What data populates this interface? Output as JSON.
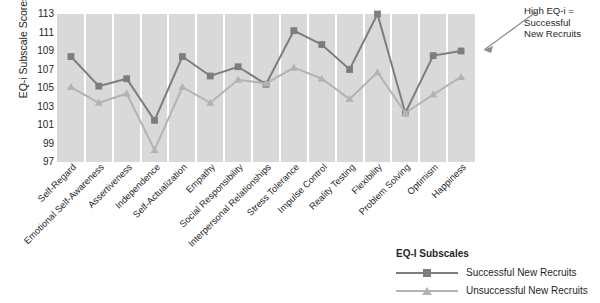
{
  "chart_data": {
    "type": "line",
    "title": "",
    "xlabel": "",
    "ylabel": "EQ-i Subscale Scores",
    "ylim": [
      97,
      113
    ],
    "ytick_step": 2,
    "yticks": [
      113,
      111,
      109,
      107,
      105,
      103,
      101,
      99,
      97
    ],
    "grid": true,
    "legend_position": "bottom-right",
    "categories": [
      "Self-Regard",
      "Emotional Self-Awareness",
      "Assertiveness",
      "Independence",
      "Self-Actualization",
      "Empathy",
      "Social Responsibility",
      "Interpersonal Relationships",
      "Stress Tolerance",
      "Impulse Control",
      "Reality Testing",
      "Flexibility",
      "Problem Solving",
      "Optimism",
      "Happiness"
    ],
    "series": [
      {
        "name": "Successful New Recruits",
        "color": "#7d7d7d",
        "marker": "square",
        "values": [
          108.4,
          105.2,
          106.0,
          101.5,
          108.4,
          106.3,
          107.3,
          105.4,
          111.2,
          109.7,
          107.0,
          113.0,
          102.3,
          108.5,
          109.0
        ]
      },
      {
        "name": "Unsuccessful New Recruits",
        "color": "#b3b3b3",
        "marker": "triangle",
        "values": [
          105.1,
          103.4,
          104.4,
          98.3,
          105.1,
          103.4,
          105.9,
          105.5,
          107.2,
          106.0,
          103.8,
          106.7,
          102.3,
          104.3,
          106.2
        ]
      }
    ],
    "annotation": "High EQ-i =\nSuccessful\nNew Recruits"
  },
  "legend": {
    "title": "EQ-I Subscales",
    "entries": [
      {
        "label": "Successful New Recruits",
        "color": "#7d7d7d",
        "marker": "square"
      },
      {
        "label": "Unsuccessful New Recruits",
        "color": "#b3b3b3",
        "marker": "triangle"
      }
    ]
  },
  "colors": {
    "plot_background": "#d9d9d9",
    "gridline": "#ffffff",
    "series_successful": "#7d7d7d",
    "series_unsuccessful": "#b3b3b3",
    "text": "#1f1f1f"
  }
}
